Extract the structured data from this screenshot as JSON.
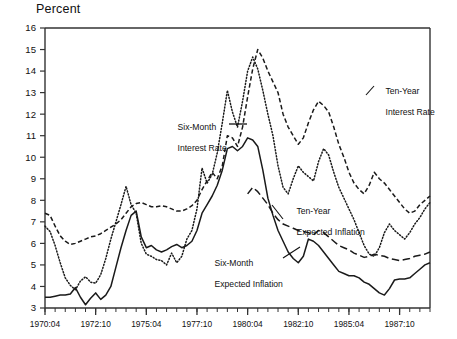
{
  "title": "Percent",
  "axis": {
    "y_label": "Percent",
    "y_ticks": [
      3,
      4,
      5,
      6,
      7,
      8,
      9,
      10,
      11,
      12,
      13,
      14,
      15,
      16
    ],
    "x_ticks": [
      "1970:04",
      "1972:10",
      "1975:04",
      "1977:10",
      "1980:04",
      "1982:10",
      "1985:04",
      "1987:10"
    ]
  },
  "annotations": [
    {
      "name": "six-month-interest-rate",
      "line1": "Six-Month",
      "line2": "Interest Rate"
    },
    {
      "name": "ten-year-interest-rate",
      "line1": "Ten-Year",
      "line2": "Interest Rate"
    },
    {
      "name": "ten-year-expected-inflation",
      "line1": "Ten-Year",
      "line2": "Expected Inflation"
    },
    {
      "name": "six-month-expected-inflation",
      "line1": "Six-Month",
      "line2": "Expected Inflation"
    }
  ],
  "chart_data": {
    "type": "line",
    "title": "",
    "xlabel": "",
    "ylabel": "Percent",
    "ylim": [
      3,
      16
    ],
    "grid": false,
    "legend": "annotated-inline",
    "x_tick_labels": [
      "1970:04",
      "1972:10",
      "1975:04",
      "1977:10",
      "1980:04",
      "1982:10",
      "1985:04",
      "1987:10"
    ],
    "x_tick_index": [
      0,
      10,
      20,
      30,
      40,
      50,
      60,
      70
    ],
    "x_index_range": [
      0,
      76
    ],
    "series": [
      {
        "name": "Six-Month Interest Rate",
        "style": "dotted",
        "color": "#1a1a1a",
        "values": [
          6.8,
          6.55,
          5.9,
          5.1,
          4.4,
          4.05,
          3.85,
          4.25,
          4.45,
          4.2,
          4.15,
          4.55,
          5.3,
          6.2,
          7.0,
          7.8,
          8.65,
          7.8,
          7.4,
          6.0,
          5.5,
          5.4,
          5.25,
          5.2,
          5.0,
          5.55,
          5.1,
          5.4,
          6.2,
          6.6,
          7.6,
          9.5,
          8.8,
          9.2,
          10.2,
          11.6,
          13.1,
          12.1,
          11.4,
          12.6,
          14.0,
          14.65,
          14.1,
          13.1,
          12.0,
          11.0,
          9.6,
          8.6,
          8.3,
          9.0,
          9.6,
          9.3,
          9.1,
          8.9,
          9.8,
          10.4,
          10.1,
          9.3,
          8.6,
          8.1,
          7.6,
          7.1,
          6.5,
          5.9,
          5.5,
          5.4,
          5.8,
          6.5,
          6.9,
          6.6,
          6.4,
          6.2,
          6.5,
          6.9,
          7.2,
          7.6,
          7.9
        ]
      },
      {
        "name": "Ten-Year Interest Rate",
        "style": "dashed",
        "color": "#1a1a1a",
        "values": [
          7.4,
          7.3,
          6.8,
          6.35,
          6.1,
          5.95,
          6.0,
          6.1,
          6.2,
          6.3,
          6.35,
          6.45,
          6.6,
          6.75,
          6.9,
          7.1,
          7.4,
          7.7,
          7.85,
          7.9,
          7.8,
          7.7,
          7.7,
          7.75,
          7.7,
          7.6,
          7.5,
          7.5,
          7.6,
          7.75,
          8.0,
          8.5,
          8.9,
          9.3,
          9.0,
          9.6,
          11.0,
          10.9,
          10.5,
          11.4,
          12.8,
          14.1,
          15.0,
          14.6,
          14.0,
          13.5,
          13.0,
          12.0,
          11.4,
          11.0,
          10.6,
          10.9,
          11.6,
          12.2,
          12.6,
          12.4,
          12.1,
          11.4,
          10.6,
          10.0,
          9.3,
          8.8,
          8.5,
          8.3,
          8.7,
          9.3,
          9.0,
          8.8,
          8.5,
          8.2,
          7.9,
          7.6,
          7.4,
          7.5,
          7.8,
          8.0,
          8.2
        ]
      },
      {
        "name": "Ten-Year Expected Inflation",
        "style": "longdash",
        "color": "#1a1a1a",
        "values": [
          null,
          null,
          null,
          null,
          null,
          null,
          null,
          null,
          null,
          null,
          null,
          null,
          null,
          null,
          null,
          null,
          null,
          null,
          null,
          null,
          null,
          null,
          null,
          null,
          null,
          null,
          null,
          null,
          null,
          null,
          null,
          null,
          null,
          null,
          null,
          null,
          null,
          null,
          null,
          null,
          8.3,
          8.6,
          8.4,
          8.1,
          7.8,
          7.4,
          7.1,
          6.9,
          6.8,
          6.7,
          6.6,
          6.55,
          6.5,
          6.4,
          6.6,
          6.5,
          6.3,
          6.1,
          5.9,
          5.8,
          5.7,
          5.55,
          5.45,
          5.35,
          5.4,
          5.5,
          5.45,
          5.4,
          5.3,
          5.25,
          5.2,
          5.25,
          5.3,
          5.4,
          5.45,
          5.5,
          5.6
        ]
      },
      {
        "name": "Six-Month Expected Inflation",
        "style": "solid",
        "color": "#1a1a1a",
        "values": [
          3.5,
          3.5,
          3.55,
          3.6,
          3.6,
          3.65,
          3.95,
          3.5,
          3.15,
          3.45,
          3.7,
          3.4,
          3.6,
          4.0,
          4.9,
          5.8,
          6.6,
          7.3,
          7.5,
          6.3,
          5.8,
          5.9,
          5.7,
          5.6,
          5.7,
          5.85,
          5.95,
          5.8,
          5.9,
          6.1,
          6.6,
          7.4,
          7.8,
          8.2,
          8.7,
          9.4,
          10.4,
          10.5,
          10.3,
          10.5,
          10.9,
          10.8,
          10.5,
          9.4,
          8.1,
          7.3,
          6.6,
          6.1,
          5.6,
          5.3,
          5.1,
          5.4,
          6.2,
          6.1,
          5.9,
          5.6,
          5.3,
          5.0,
          4.7,
          4.6,
          4.5,
          4.5,
          4.4,
          4.2,
          4.1,
          3.9,
          3.7,
          3.6,
          3.9,
          4.3,
          4.35,
          4.35,
          4.4,
          4.6,
          4.8,
          5.0,
          5.1
        ]
      }
    ]
  }
}
